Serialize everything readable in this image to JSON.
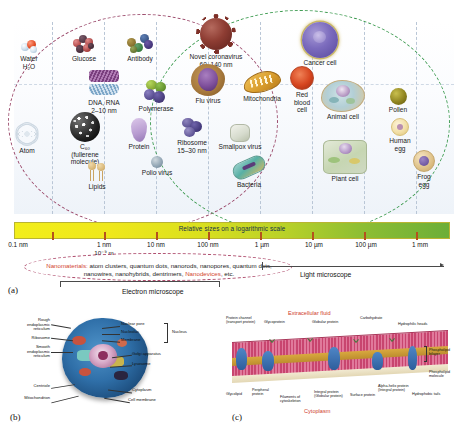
{
  "figure": {
    "panel_a_tag": "(a)",
    "panel_b_tag": "(b)",
    "panel_c_tag": "(c)"
  },
  "scale": {
    "bar_label": "Relative sizes on a logarithmic scale",
    "ticks": [
      "0.1 nm",
      "1 nm",
      "10 nm",
      "100 nm",
      "1 µm",
      "10 µm",
      "100 µm",
      "1 mm"
    ],
    "exponent_note": "10⁻⁹ m",
    "light_microscope": "Light microscope",
    "electron_microscope": "Electron microscope",
    "nanomaterials_lead": "Nanomaterials:",
    "nanomaterials_body": " atom clusters, quantum dots, nanorods, nanopores, quantum dots, nanowires, nanohybrids, dentrimers, ",
    "nanomaterials_hl2": "Nanodevices",
    "nanomaterials_tail": ", etc.",
    "accent_nano": "#d2452e",
    "accent_nano_ellipse": "#9d4d6e",
    "accent_bio_ellipse": "#3f9c52"
  },
  "specimens": [
    {
      "name": "water",
      "label": "Water\nH₂O"
    },
    {
      "name": "glucose",
      "label": "Glucose"
    },
    {
      "name": "antibody",
      "label": "Antibody"
    },
    {
      "name": "coronavirus",
      "label": "Novel coronavirus\n60–140 nm"
    },
    {
      "name": "cancer-cell",
      "label": "Cancer cell"
    },
    {
      "name": "dna-rna",
      "label": "DNA, RNA\n2–10 nm"
    },
    {
      "name": "polymerase",
      "label": "Polymerase"
    },
    {
      "name": "flu-virus",
      "label": "Flu virus"
    },
    {
      "name": "mitochondria",
      "label": "Mitochondria"
    },
    {
      "name": "red-blood-cell",
      "label": "Red\nblood\ncell"
    },
    {
      "name": "animal-cell",
      "label": "Animal cell"
    },
    {
      "name": "pollen",
      "label": "Pollen"
    },
    {
      "name": "atom",
      "label": "Atom"
    },
    {
      "name": "fullerene",
      "label": "C₆₀\n(fullerene\nmolecule)"
    },
    {
      "name": "protein",
      "label": "Protein"
    },
    {
      "name": "ribosome",
      "label": "Ribosome\n15–30 nm"
    },
    {
      "name": "smallpox-virus",
      "label": "Smallpox virus"
    },
    {
      "name": "human-egg",
      "label": "Human\negg"
    },
    {
      "name": "lipids",
      "label": "Lipids"
    },
    {
      "name": "polio-virus",
      "label": "Polio virus"
    },
    {
      "name": "bacteria",
      "label": "Bacteria"
    },
    {
      "name": "plant-cell",
      "label": "Plant cell"
    },
    {
      "name": "frog-egg",
      "label": "Frog\negg"
    }
  ],
  "cell_diagram": {
    "labels_left": [
      "Rough\nendoplasmic\nreticulum",
      "Ribosome",
      "Smooth\nendoplasmic\nreticulum",
      "Centriole",
      "Mitochondrion"
    ],
    "labels_right": [
      "Nuclear pore",
      "Nucleolus",
      "Membrane",
      "Golgi apparatus",
      "Lysosome",
      "Cytoplasm",
      "Cell membrane"
    ],
    "group_label": "Nucleus"
  },
  "membrane_diagram": {
    "top_region": "Extracellular fluid",
    "bottom_region": "Cytoplasm",
    "labels": [
      "Protein channel\n(transport protein)",
      "Glycoprotein",
      "Globular protein",
      "Carbohydrate",
      "Hydrophilic heads",
      "Phospholipid\nbilayer",
      "Phospholipid\nmolecule",
      "Glycolipid",
      "Peripheral\nprotein",
      "Filaments of\ncytoskeleton",
      "Integral protein\n(Globular protein)",
      "Surface protein",
      "Alpha-helix protein\n(Integral protein)",
      "Hydrophobic tails"
    ],
    "region_color": "#cf3b2a"
  }
}
